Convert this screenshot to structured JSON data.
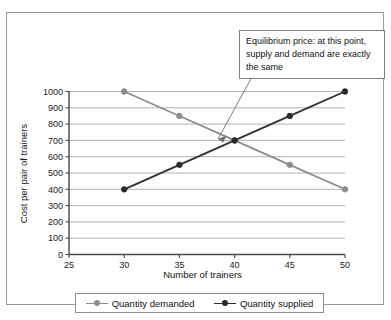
{
  "figure": {
    "annotation": {
      "text": "Equilibrium price: at this point, supply and demand are exactly the same"
    }
  },
  "chart_data": {
    "type": "line",
    "title": "",
    "xlabel": "Number of trainers",
    "ylabel": "Cost per pair of trainers",
    "xlim": [
      25,
      50
    ],
    "ylim": [
      0,
      1000
    ],
    "xticks": [
      25,
      30,
      35,
      40,
      45,
      50
    ],
    "yticks": [
      0,
      100,
      200,
      300,
      400,
      500,
      600,
      700,
      800,
      900,
      1000
    ],
    "xtick_labels": [
      "25",
      "30",
      "35",
      "40",
      "45",
      "50"
    ],
    "ytick_labels": [
      "0",
      "100",
      "200",
      "300",
      "400",
      "500",
      "600",
      "700",
      "800",
      "900",
      "1000"
    ],
    "grid": "horizontal",
    "legend_position": "bottom",
    "x": [
      30,
      35,
      40,
      45,
      50
    ],
    "series": [
      {
        "name": "Quantity demanded",
        "color": "#8c8c8c",
        "x": [
          30,
          35,
          40,
          45,
          50
        ],
        "values": [
          1000,
          850,
          700,
          550,
          400
        ]
      },
      {
        "name": "Quantity supplied",
        "color": "#2b2b2b",
        "x": [
          30,
          35,
          40,
          45,
          50
        ],
        "values": [
          400,
          550,
          700,
          850,
          1000
        ]
      }
    ],
    "annotations": [
      {
        "text": "Equilibrium price: at this point, supply and demand are exactly the same",
        "points_to_x": 40,
        "points_to_y": 700
      }
    ]
  }
}
